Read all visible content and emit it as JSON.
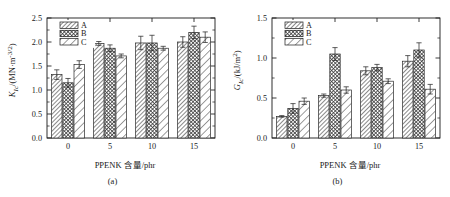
{
  "figure": {
    "panels": [
      "a",
      "b"
    ]
  },
  "panel_a": {
    "caption": "(a)",
    "xlabel": "PPENK 含量/phr",
    "ylabel_main": "K",
    "ylabel_sub": "Ic",
    "ylabel_unit": "/(MN·m",
    "ylabel_exp": "-3/2",
    "ylabel_tail": ")",
    "legend": [
      "A",
      "B",
      "C"
    ]
  },
  "panel_b": {
    "caption": "(b)",
    "xlabel": "PPENK 含量/phr",
    "ylabel_main": "G",
    "ylabel_sub": "Ic",
    "ylabel_unit": "/(kJ/m",
    "ylabel_exp": "2",
    "ylabel_tail": ")",
    "legend": [
      "A",
      "B",
      "C"
    ]
  },
  "chart_data": [
    {
      "type": "bar",
      "panel": "a",
      "title": "",
      "xlabel": "PPENK 含量/phr",
      "ylabel": "K_Ic/(MN·m^-3/2)",
      "categories": [
        "0",
        "5",
        "10",
        "15"
      ],
      "ylim": [
        0.0,
        2.5
      ],
      "yticks": [
        "0.0",
        "0.5",
        "1.0",
        "1.5",
        "2.0",
        "2.5"
      ],
      "ytick_values": [
        0.0,
        0.5,
        1.0,
        1.5,
        2.0,
        2.5
      ],
      "grid": false,
      "legend_position": "top-left",
      "series": [
        {
          "name": "A",
          "values": [
            1.32,
            1.97,
            1.98,
            2.0
          ],
          "errors": [
            0.1,
            0.04,
            0.14,
            0.11
          ],
          "hatch": "fine-diagonal"
        },
        {
          "name": "B",
          "values": [
            1.15,
            1.87,
            1.98,
            2.2
          ],
          "errors": [
            0.09,
            0.07,
            0.16,
            0.13
          ],
          "hatch": "dense-crosshatch"
        },
        {
          "name": "C",
          "values": [
            1.53,
            1.71,
            1.87,
            2.1
          ],
          "errors": [
            0.08,
            0.04,
            0.04,
            0.11
          ],
          "hatch": "wide-diagonal"
        }
      ]
    },
    {
      "type": "bar",
      "panel": "b",
      "title": "",
      "xlabel": "PPENK 含量/phr",
      "ylabel": "G_Ic/(kJ/m^2)",
      "categories": [
        "0",
        "5",
        "10",
        "15"
      ],
      "ylim": [
        0.0,
        1.5
      ],
      "yticks": [
        "0.0",
        "0.5",
        "1.0",
        "1.5"
      ],
      "ytick_values": [
        0.0,
        0.5,
        1.0,
        1.5
      ],
      "grid": false,
      "legend_position": "top-left",
      "series": [
        {
          "name": "A",
          "values": [
            0.27,
            0.53,
            0.84,
            0.96
          ],
          "errors": [
            0.01,
            0.02,
            0.05,
            0.07
          ],
          "hatch": "fine-diagonal"
        },
        {
          "name": "B",
          "values": [
            0.37,
            1.05,
            0.88,
            1.1
          ],
          "errors": [
            0.06,
            0.08,
            0.04,
            0.09
          ],
          "hatch": "dense-crosshatch"
        },
        {
          "name": "C",
          "values": [
            0.46,
            0.6,
            0.71,
            0.61
          ],
          "errors": [
            0.04,
            0.04,
            0.03,
            0.06
          ],
          "hatch": "wide-diagonal"
        }
      ]
    }
  ]
}
